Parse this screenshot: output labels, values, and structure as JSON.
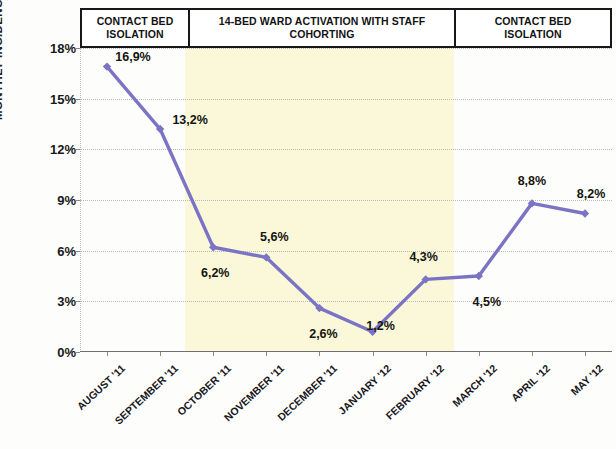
{
  "chart_data": {
    "type": "line",
    "title": "",
    "subtitle": "",
    "xlabel": "",
    "ylabel": "MONTHLY INCIDENCE",
    "ylim": [
      0,
      18
    ],
    "ytick_values": [
      18,
      15,
      12,
      9,
      6,
      3,
      0
    ],
    "ytick_labels": [
      "18%",
      "15%",
      "12%",
      "9%",
      "6%",
      "3%",
      "0%"
    ],
    "grid": true,
    "legend": "none",
    "decimal_separator": ",",
    "categories": [
      "AUGUST '11",
      "SEPTEMBER '11",
      "OCTOBER '11",
      "NOVEMBER '11",
      "DECEMBER '11",
      "JANUARY '12",
      "FEBRUARY '12",
      "MARCH '12",
      "APRIL '12",
      "MAY '12"
    ],
    "values": [
      16.9,
      13.2,
      6.2,
      5.6,
      2.6,
      1.2,
      4.3,
      4.5,
      8.8,
      8.2
    ],
    "point_labels": [
      "16,9%",
      "13,2%",
      "6,2%",
      "5,6%",
      "2,6%",
      "1,2%",
      "4,3%",
      "4,5%",
      "8,8%",
      "8,2%"
    ],
    "series_color": "#7b74c4",
    "marker": "diamond",
    "annotations": [
      {
        "label": "CONTACT BED ISOLATION",
        "line1": "CONTACT BED",
        "line2": "ISOLATION",
        "from_category": "AUGUST '11",
        "to_category": "SEPTEMBER '11"
      },
      {
        "label": "14-BED WARD ACTIVATION WITH STAFF COHORTING",
        "line1": "14-BED WARD ACTIVATION WITH STAFF",
        "line2": "COHORTING",
        "from_category": "OCTOBER '11",
        "to_category": "FEBRUARY '12",
        "shaded": true,
        "shade_color": "#fbf8da"
      },
      {
        "label": "CONTACT BED ISOLATION",
        "line1": "CONTACT BED",
        "line2": "ISOLATION",
        "from_category": "MARCH '12",
        "to_category": "MAY '12"
      }
    ]
  }
}
